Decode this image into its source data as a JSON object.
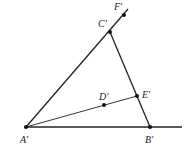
{
  "diagram": {
    "type": "geometry",
    "colors": {
      "line": "#222222",
      "point": "#111111",
      "background": "#ffffff"
    },
    "points": [
      {
        "id": "A",
        "label": "A′",
        "x": 26,
        "y": 127,
        "label_x": 20,
        "label_y": 143
      },
      {
        "id": "B",
        "label": "B′",
        "x": 150,
        "y": 127,
        "label_x": 145,
        "label_y": 143
      },
      {
        "id": "C",
        "label": "C′",
        "x": 110,
        "y": 32,
        "label_x": 98,
        "label_y": 27
      },
      {
        "id": "D",
        "label": "D′",
        "x": 104,
        "y": 105,
        "label_x": 99,
        "label_y": 100
      },
      {
        "id": "E",
        "label": "E′",
        "x": 137,
        "y": 96,
        "label_x": 142,
        "label_y": 98
      },
      {
        "id": "F",
        "label": "F′",
        "x": 124,
        "y": 15,
        "label_x": 114,
        "label_y": 10
      }
    ],
    "segments": [
      {
        "name": "ray-a-c-f",
        "from": "A",
        "x1": 26,
        "y1": 127,
        "x2": 128,
        "y2": 9
      },
      {
        "name": "segment-c-b",
        "from": "C",
        "x1": 110,
        "y1": 32,
        "x2": 150,
        "y2": 127
      },
      {
        "name": "segment-a-e",
        "from": "A",
        "x1": 26,
        "y1": 127,
        "x2": 137,
        "y2": 96
      },
      {
        "name": "ray-a-b",
        "from": "A",
        "x1": 26,
        "y1": 127,
        "x2": 182,
        "y2": 127
      }
    ]
  }
}
